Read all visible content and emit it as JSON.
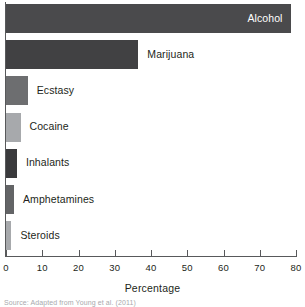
{
  "chart_data": {
    "type": "bar",
    "orientation": "horizontal",
    "title": "",
    "xlabel": "Percentage",
    "ylabel": "",
    "xlim": [
      0,
      80
    ],
    "grid": false,
    "legend": null,
    "categories": [
      "Alcohol",
      "Marijuana",
      "Ecstasy",
      "Cocaine",
      "Inhalants",
      "Amphetamines",
      "Steroids"
    ],
    "values": [
      78.5,
      36.5,
      6.0,
      4.0,
      3.0,
      2.2,
      1.5
    ],
    "bar_colors": [
      "#4a4a4c",
      "#414143",
      "#6d6e70",
      "#a7a9ac",
      "#3a3a3c",
      "#636466",
      "#a7a9ac"
    ],
    "label_placement": [
      "inside",
      "outside",
      "outside",
      "outside",
      "outside",
      "outside",
      "outside"
    ],
    "xticks": [
      0,
      10,
      20,
      30,
      40,
      50,
      60,
      70,
      80
    ],
    "xticklabels": [
      "0",
      "10",
      "20",
      "30",
      "40",
      "50",
      "60",
      "70",
      "80"
    ]
  },
  "axis": {
    "x_title": "Percentage"
  },
  "caption": {
    "source": "Source: Adapted from Young et al. (2011)"
  }
}
